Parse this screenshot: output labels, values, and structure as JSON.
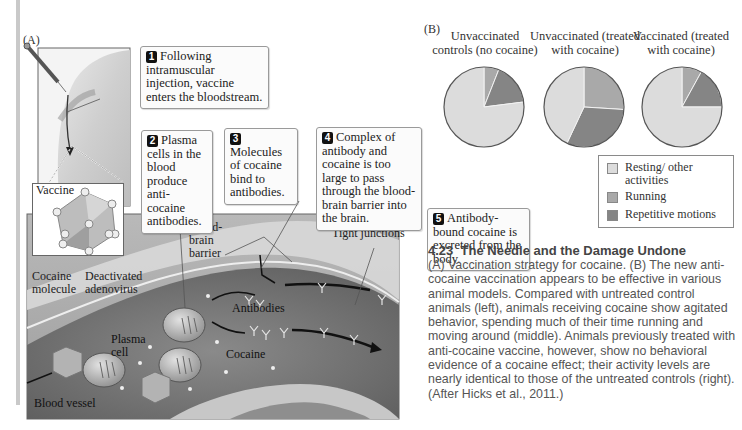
{
  "figure": {
    "number": "4.23",
    "title": "The Needle and the Damage Undone",
    "caption": "(A) Vaccination strategy for cocaine. (B) The new anti-cocaine vaccination appears to be effective in various animal models. Compared with untreated control animals (left), animals receiving cocaine show agitated behavior, spending much of their time running and moving around (middle). Animals previously treated with anti-cocaine vaccine, however, show no behavioral evidence of a cocaine effect; their activity levels are nearly identical to those of the untreated controls (right). (After Hicks et al., 2011.)"
  },
  "panel_a": {
    "label": "(A)",
    "steps": [
      {
        "num": "1",
        "text": "Following intramuscular injection, vaccine enters the bloodstream."
      },
      {
        "num": "2",
        "text": "Plasma cells in the blood produce anti-cocaine antibodies."
      },
      {
        "num": "3",
        "text": "Molecules of cocaine bind to antibodies."
      },
      {
        "num": "4",
        "text": "Complex of antibody and cocaine is too large to pass through the blood-brain barrier into the brain."
      },
      {
        "num": "5",
        "text": "Antibody-bound cocaine is excreted from the body."
      }
    ],
    "labels": {
      "vaccine": "Vaccine",
      "cocaine_molecule": "Cocaine molecule",
      "deactivated_adenovirus": "Deactivated adenovirus",
      "blood_brain_barrier": "Blood-brain barrier",
      "tight_junctions": "Tight junctions",
      "antibodies": "Antibodies",
      "plasma_cell": "Plasma cell",
      "cocaine": "Cocaine",
      "blood_vessel": "Blood vessel"
    }
  },
  "panel_b": {
    "label": "(B)",
    "legend": [
      {
        "label": "Resting/ other activities",
        "color": "#dcdcdc"
      },
      {
        "label": "Running",
        "color": "#a9a9a9"
      },
      {
        "label": "Repetitive motions",
        "color": "#858585"
      }
    ]
  },
  "chart_data": {
    "type": "pie",
    "title": "",
    "categories": [
      "Resting/other activities",
      "Running",
      "Repetitive motions"
    ],
    "colors": [
      "#dcdcdc",
      "#a9a9a9",
      "#858585"
    ],
    "pies": [
      {
        "title": "Unvaccinated controls (no cocaine)",
        "values": [
          77,
          6,
          17
        ]
      },
      {
        "title": "Unvaccinated (treated with cocaine)",
        "values": [
          43,
          26,
          31
        ]
      },
      {
        "title": "Vaccinated (treated with cocaine)",
        "values": [
          75,
          8,
          17
        ]
      }
    ],
    "legend_position": "bottom-right"
  }
}
